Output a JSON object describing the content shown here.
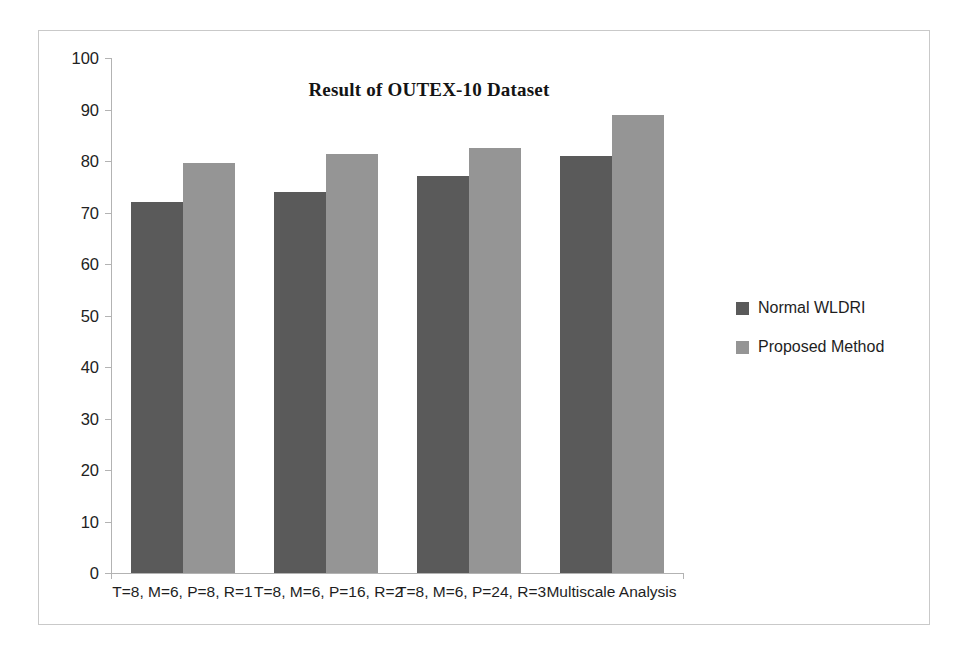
{
  "chart_data": {
    "type": "bar",
    "title": "Result of OUTEX-10 Dataset",
    "xlabel": "",
    "ylabel": "",
    "ylim": [
      0,
      100
    ],
    "ytick_step": 10,
    "grid": false,
    "legend_position": "right",
    "categories": [
      "T=8, M=6, P=8, R=1",
      "T=8, M=6, P=16, R=2",
      "T=8, M=6, P=24, R=3",
      "Multiscale Analysis"
    ],
    "ytick_labels": [
      "100",
      "90",
      "80",
      "70",
      "60",
      "50",
      "40",
      "30",
      "20",
      "10",
      "0"
    ],
    "ytick_values": [
      100,
      90,
      80,
      70,
      60,
      50,
      40,
      30,
      20,
      10,
      0
    ],
    "series": [
      {
        "name": "Normal WLDRI",
        "color": "#5a5a5a",
        "values": [
          72.0,
          74.0,
          77.0,
          81.0
        ]
      },
      {
        "name": "Proposed Method",
        "color": "#959595",
        "values": [
          79.7,
          81.3,
          82.6,
          89.0
        ]
      }
    ]
  },
  "legend": {
    "items": [
      {
        "label": "Normal WLDRI",
        "color": "#5a5a5a"
      },
      {
        "label": "Proposed Method",
        "color": "#959595"
      }
    ]
  },
  "colors": {
    "series_dark": "#5a5a5a",
    "series_light": "#959595",
    "frame_border": "#c9c9c9",
    "axis_line": "#b3b3b3",
    "background": "#ffffff"
  }
}
